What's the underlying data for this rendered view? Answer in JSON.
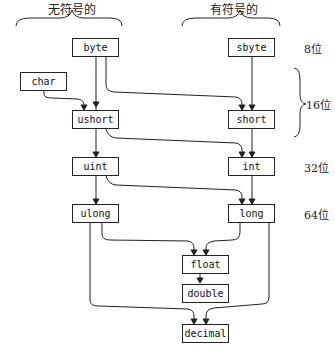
{
  "headers": {
    "unsigned": "无符号的",
    "signed": "有符号的"
  },
  "bit_labels": {
    "b8": "8位",
    "b16": "16位",
    "b32": "32位",
    "b64": "64位"
  },
  "nodes": {
    "byte": "byte",
    "sbyte": "sbyte",
    "char": "char",
    "ushort": "ushort",
    "short": "short",
    "uint": "uint",
    "int": "int",
    "ulong": "ulong",
    "long": "long",
    "float": "float",
    "double": "double",
    "decimal": "decimal"
  },
  "edges": [
    [
      "byte",
      "ushort"
    ],
    [
      "byte",
      "short"
    ],
    [
      "sbyte",
      "short"
    ],
    [
      "char",
      "ushort"
    ],
    [
      "ushort",
      "uint"
    ],
    [
      "ushort",
      "int"
    ],
    [
      "short",
      "int"
    ],
    [
      "uint",
      "ulong"
    ],
    [
      "uint",
      "long"
    ],
    [
      "int",
      "long"
    ],
    [
      "ulong",
      "float"
    ],
    [
      "long",
      "float"
    ],
    [
      "float",
      "double"
    ],
    [
      "ulong",
      "decimal"
    ],
    [
      "long",
      "decimal"
    ]
  ]
}
